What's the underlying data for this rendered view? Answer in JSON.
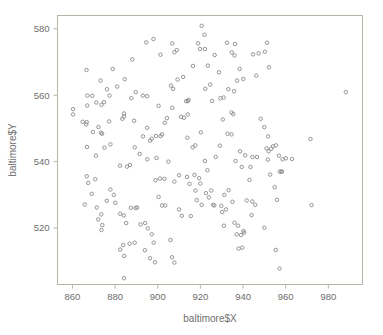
{
  "chart_data": {
    "type": "scatter",
    "title": "",
    "xlabel": "baltimore$X",
    "ylabel": "baltimore$Y",
    "xlim": [
      853,
      996
    ],
    "ylim": [
      503,
      584
    ],
    "xticks": [
      860,
      880,
      900,
      920,
      940,
      960,
      980
    ],
    "xticklabels": [
      "860",
      "880",
      "900",
      "920",
      "940",
      "960",
      "980"
    ],
    "yticks": [
      520,
      540,
      560,
      580
    ],
    "yticklabels": [
      "520",
      "540",
      "560",
      "580"
    ],
    "grid": false,
    "legend": null,
    "marker": "open-circle",
    "marker_color": "#8a8a8a",
    "frame_color": "#b8b4a8",
    "background_color": "#ffffff",
    "n_points": 211,
    "points": [
      [
        860.3,
        555.8
      ],
      [
        860.3,
        554.2
      ],
      [
        866.6,
        567.6
      ],
      [
        867.0,
        559.9
      ],
      [
        869.3,
        559.8
      ],
      [
        866.9,
        556.9
      ],
      [
        871.2,
        557.8
      ],
      [
        873.6,
        557.1
      ],
      [
        874.8,
        557.9
      ],
      [
        873.2,
        564.4
      ],
      [
        876.2,
        561.8
      ],
      [
        878.9,
        567.9
      ],
      [
        877.4,
        559.9
      ],
      [
        881.0,
        562.6
      ],
      [
        884.5,
        564.8
      ],
      [
        888.1,
        570.8
      ],
      [
        887.6,
        559.1
      ],
      [
        889.7,
        560.9
      ],
      [
        893.0,
        559.9
      ],
      [
        895.0,
        559.7
      ],
      [
        894.6,
        575.9
      ],
      [
        898.0,
        576.9
      ],
      [
        901.3,
        572.2
      ],
      [
        900.4,
        556.8
      ],
      [
        903.3,
        551.7
      ],
      [
        906.8,
        575.6
      ],
      [
        907.8,
        572.9
      ],
      [
        908.9,
        573.6
      ],
      [
        906.2,
        562.9
      ],
      [
        907.2,
        561.9
      ],
      [
        909.3,
        564.7
      ],
      [
        911.9,
        565.5
      ],
      [
        913.3,
        558.2
      ],
      [
        914.1,
        558.2
      ],
      [
        914.4,
        558.6
      ],
      [
        916.5,
        568.8
      ],
      [
        918.9,
        575.6
      ],
      [
        919.8,
        573.9
      ],
      [
        920.6,
        580.9
      ],
      [
        921.9,
        578.2
      ],
      [
        922.1,
        573.9
      ],
      [
        923.5,
        568.9
      ],
      [
        924.6,
        563.2
      ],
      [
        922.3,
        561.9
      ],
      [
        926.7,
        572.1
      ],
      [
        925.5,
        558.3
      ],
      [
        929.4,
        559.1
      ],
      [
        930.9,
        559.3
      ],
      [
        928.7,
        566.9
      ],
      [
        932.5,
        575.8
      ],
      [
        934.7,
        572.9
      ],
      [
        936.2,
        575.4
      ],
      [
        936.0,
        572.0
      ],
      [
        933.1,
        561.8
      ],
      [
        935.8,
        561.2
      ],
      [
        937.2,
        564.4
      ],
      [
        938.4,
        567.9
      ],
      [
        940.1,
        564.9
      ],
      [
        944.7,
        572.3
      ],
      [
        946.2,
        565.9
      ],
      [
        947.3,
        572.6
      ],
      [
        950.2,
        573.1
      ],
      [
        951.3,
        575.8
      ],
      [
        952.1,
        568.4
      ],
      [
        988.2,
        560.9
      ],
      [
        864.8,
        552.0
      ],
      [
        866.7,
        551.9
      ],
      [
        866.5,
        551.2
      ],
      [
        869.6,
        548.9
      ],
      [
        872.2,
        550.4
      ],
      [
        873.4,
        548.7
      ],
      [
        873.9,
        548.4
      ],
      [
        877.2,
        552.1
      ],
      [
        883.4,
        552.9
      ],
      [
        884.2,
        554.5
      ],
      [
        884.2,
        553.6
      ],
      [
        888.9,
        552.3
      ],
      [
        895.0,
        550.2
      ],
      [
        893.1,
        547.6
      ],
      [
        896.4,
        546.3
      ],
      [
        899.4,
        541.1
      ],
      [
        901.3,
        547.7
      ],
      [
        902.0,
        548.2
      ],
      [
        904.3,
        553.1
      ],
      [
        906.8,
        556.2
      ],
      [
        910.9,
        553.5
      ],
      [
        912.3,
        553.2
      ],
      [
        914.1,
        554.2
      ],
      [
        913.9,
        547.2
      ],
      [
        916.4,
        544.3
      ],
      [
        917.6,
        544.9
      ],
      [
        920.2,
        548.8
      ],
      [
        922.1,
        540.2
      ],
      [
        923.3,
        537.4
      ],
      [
        927.2,
        541.4
      ],
      [
        929.1,
        544.8
      ],
      [
        930.5,
        552.7
      ],
      [
        932.7,
        548.4
      ],
      [
        934.6,
        548.2
      ],
      [
        934.6,
        554.8
      ],
      [
        935.4,
        554.3
      ],
      [
        936.5,
        540.2
      ],
      [
        938.6,
        543.1
      ],
      [
        939.4,
        538.4
      ],
      [
        941.0,
        541.9
      ],
      [
        944.4,
        541.4
      ],
      [
        948.3,
        552.9
      ],
      [
        950.0,
        550.4
      ],
      [
        951.8,
        547.6
      ],
      [
        953.2,
        543.9
      ],
      [
        955.4,
        544.9
      ],
      [
        956.8,
        541.8
      ],
      [
        958.5,
        540.7
      ],
      [
        971.6,
        546.8
      ],
      [
        952.7,
        536.1
      ],
      [
        957.2,
        537.0
      ],
      [
        957.9,
        537.0
      ],
      [
        958.3,
        537.0
      ],
      [
        866.8,
        544.4
      ],
      [
        871.0,
        541.8
      ],
      [
        875.0,
        544.2
      ],
      [
        877.8,
        545.2
      ],
      [
        882.3,
        538.8
      ],
      [
        885.6,
        538.5
      ],
      [
        887.0,
        539.0
      ],
      [
        889.2,
        544.3
      ],
      [
        891.5,
        542.3
      ],
      [
        895.1,
        540.7
      ],
      [
        897.2,
        546.9
      ],
      [
        899.2,
        547.7
      ],
      [
        899.0,
        534.4
      ],
      [
        901.0,
        534.9
      ],
      [
        903.1,
        534.8
      ],
      [
        905.0,
        540.0
      ],
      [
        907.8,
        534.0
      ],
      [
        910.0,
        535.9
      ],
      [
        913.7,
        535.4
      ],
      [
        914.9,
        533.3
      ],
      [
        866.7,
        535.6
      ],
      [
        867.4,
        533.6
      ],
      [
        870.7,
        534.7
      ],
      [
        865.8,
        527.1
      ],
      [
        869.0,
        530.3
      ],
      [
        871.4,
        526.2
      ],
      [
        872.1,
        522.6
      ],
      [
        873.5,
        524.1
      ],
      [
        874.0,
        520.9
      ],
      [
        873.6,
        519.4
      ],
      [
        876.1,
        528.2
      ],
      [
        877.8,
        531.6
      ],
      [
        879.4,
        530.0
      ],
      [
        880.1,
        527.6
      ],
      [
        882.4,
        524.3
      ],
      [
        884.1,
        523.8
      ],
      [
        885.2,
        521.5
      ],
      [
        887.4,
        526.1
      ],
      [
        889.6,
        526.0
      ],
      [
        890.3,
        526.2
      ],
      [
        891.9,
        521.1
      ],
      [
        894.1,
        521.5
      ],
      [
        895.3,
        519.9
      ],
      [
        897.2,
        518.1
      ],
      [
        900.4,
        529.4
      ],
      [
        902.0,
        526.8
      ],
      [
        903.5,
        526.8
      ],
      [
        906.0,
        516.4
      ],
      [
        898.1,
        515.6
      ],
      [
        894.0,
        513.3
      ],
      [
        896.4,
        510.9
      ],
      [
        898.7,
        509.7
      ],
      [
        882.4,
        513.5
      ],
      [
        883.8,
        514.9
      ],
      [
        884.3,
        511.6
      ],
      [
        886.8,
        515.3
      ],
      [
        889.2,
        515.6
      ],
      [
        884.2,
        504.9
      ],
      [
        906.7,
        511.2
      ],
      [
        907.8,
        509.6
      ],
      [
        910.0,
        525.6
      ],
      [
        911.3,
        523.7
      ],
      [
        917.7,
        531.3
      ],
      [
        918.3,
        528.4
      ],
      [
        920.6,
        527.0
      ],
      [
        922.6,
        530.5
      ],
      [
        924.0,
        529.2
      ],
      [
        931.2,
        530.0
      ],
      [
        932.0,
        525.6
      ],
      [
        931.0,
        520.7
      ],
      [
        933.2,
        531.4
      ],
      [
        935.0,
        527.9
      ],
      [
        936.0,
        521.6
      ],
      [
        937.7,
        520.7
      ],
      [
        937.0,
        518.1
      ],
      [
        939.1,
        517.9
      ],
      [
        940.2,
        519.1
      ],
      [
        940.5,
        518.6
      ],
      [
        937.9,
        513.8
      ],
      [
        939.6,
        514.1
      ],
      [
        944.0,
        523.9
      ],
      [
        945.7,
        527.0
      ],
      [
        950.0,
        520.1
      ],
      [
        955.3,
        513.4
      ],
      [
        957.1,
        507.8
      ],
      [
        954.8,
        532.3
      ],
      [
        955.9,
        528.5
      ],
      [
        972.1,
        526.9
      ],
      [
        929.8,
        526.7
      ],
      [
        926.5,
        526.8
      ],
      [
        930.2,
        524.8
      ],
      [
        944.3,
        528.0
      ],
      [
        941.7,
        528.3
      ],
      [
        915.5,
        523.6
      ],
      [
        943.5,
        538.4
      ],
      [
        946.5,
        541.4
      ],
      [
        951.6,
        540.6
      ],
      [
        952.0,
        543.1
      ],
      [
        954.0,
        544.6
      ],
      [
        960.1,
        541.0
      ],
      [
        963.0,
        540.8
      ],
      [
        951.0,
        544.0
      ],
      [
        917.2,
        536.0
      ],
      [
        919.4,
        535.0
      ],
      [
        920.0,
        533.4
      ],
      [
        925.1,
        531.3
      ],
      [
        926.0,
        527.0
      ],
      [
        943.0,
        534.5
      ]
    ]
  },
  "axis": {
    "x_title": "baltimore$X",
    "y_title": "baltimore$Y"
  }
}
